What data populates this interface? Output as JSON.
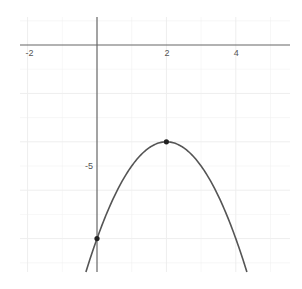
{
  "chart_data": {
    "type": "line",
    "title": "",
    "xlabel": "",
    "ylabel": "",
    "function": "y = -(x - 2)^2 - 4",
    "xlim": [
      -2.2,
      5.5
    ],
    "ylim": [
      -9.4,
      1.2
    ],
    "grid": true,
    "x_ticks": [
      {
        "value": -2,
        "label": "-2"
      },
      {
        "value": 2,
        "label": "2"
      },
      {
        "value": 4,
        "label": "4"
      }
    ],
    "y_ticks": [
      {
        "value": -5,
        "label": "-5"
      }
    ],
    "series": [
      {
        "name": "parabola",
        "color": "#555555",
        "x": [
          -0.32,
          0,
          0.5,
          1,
          1.5,
          2,
          2.5,
          3,
          3.5,
          4,
          4.32
        ],
        "y": [
          -9.38,
          -8,
          -6.25,
          -5,
          -4.25,
          -4,
          -4.25,
          -5,
          -6.25,
          -8,
          -9.38
        ]
      }
    ],
    "points": [
      {
        "name": "vertex",
        "x": 2,
        "y": -4
      },
      {
        "name": "y-intercept",
        "x": 0,
        "y": -8
      }
    ]
  },
  "colors": {
    "axis": "#666666",
    "grid": "#eeeeee",
    "curve": "#555555",
    "point": "#222222",
    "background": "#ffffff"
  }
}
